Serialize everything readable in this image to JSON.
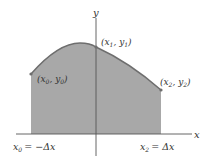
{
  "diagram": {
    "title": "",
    "colors": {
      "fill": "#a8a8a8",
      "curve": "#6e6e6e",
      "axis": "#555555",
      "text": "#333333",
      "background": "#ffffff"
    },
    "axes": {
      "x_label": "x",
      "y_label": "y"
    },
    "points": [
      {
        "id": "p0",
        "x_var": "x",
        "x_sub": "0",
        "y_var": "y",
        "y_sub": "0"
      },
      {
        "id": "p1",
        "x_var": "x",
        "x_sub": "1",
        "y_var": "y",
        "y_sub": "1"
      },
      {
        "id": "p2",
        "x_var": "x",
        "x_sub": "2",
        "y_var": "y",
        "y_sub": "2"
      }
    ],
    "bounds": {
      "left": {
        "var": "x",
        "sub": "0",
        "rhs": "= −Δx"
      },
      "right": {
        "var": "x",
        "sub": "2",
        "rhs": "= Δx"
      }
    }
  }
}
